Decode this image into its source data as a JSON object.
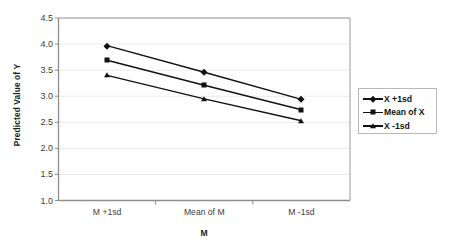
{
  "chart_data": {
    "type": "line",
    "title": "",
    "xlabel": "M",
    "ylabel": "Predicted Value of Y",
    "categories": [
      "M +1sd",
      "Mean of M",
      "M -1sd"
    ],
    "ylim": [
      1.0,
      4.5
    ],
    "yticks": [
      "1.0",
      "1.5",
      "2.0",
      "2.5",
      "3.0",
      "3.5",
      "4.0",
      "4.5"
    ],
    "ytick_values": [
      1.0,
      1.5,
      2.0,
      2.5,
      3.0,
      3.5,
      4.0,
      4.5
    ],
    "grid": "horizontal",
    "legend_position": "right",
    "series": [
      {
        "name": "X +1sd",
        "marker": "diamond",
        "values": [
          3.97,
          3.46,
          2.94
        ]
      },
      {
        "name": "Mean of X",
        "marker": "square",
        "values": [
          3.69,
          3.21,
          2.74
        ]
      },
      {
        "name": "X -1sd",
        "marker": "triangle",
        "values": [
          3.4,
          2.95,
          2.53
        ]
      }
    ]
  },
  "colors": {
    "line": "#111111",
    "grid": "#e9e9e9",
    "axis": "#9a9a9a",
    "text": "#3d3d3d",
    "title_text": "#1a1a1a",
    "legend_border": "#b9b9b9",
    "background": "#ffffff"
  },
  "legend": {
    "entries": [
      {
        "label": "X +1sd",
        "marker": "diamond-marker-icon"
      },
      {
        "label": "Mean of X",
        "marker": "square-marker-icon"
      },
      {
        "label": "X -1sd",
        "marker": "triangle-marker-icon"
      }
    ]
  }
}
